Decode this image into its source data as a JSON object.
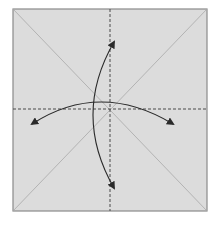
{
  "diagram": {
    "type": "origami-step",
    "colors": {
      "background": "#ffffff",
      "paper_fill": "#dcdcdc",
      "paper_border": "#8a8a8a",
      "crease_line": "#a8a8a8",
      "dashed_line": "#4a4a4a",
      "arrow": "#2a2a2a"
    },
    "paper": {
      "x": 13,
      "y": 9,
      "width": 194,
      "height": 202
    },
    "creases": [
      {
        "name": "diagonal-tl-br",
        "x1": 13,
        "y1": 9,
        "x2": 207,
        "y2": 211
      },
      {
        "name": "diagonal-tr-bl",
        "x1": 207,
        "y1": 9,
        "x2": 13,
        "y2": 211
      }
    ],
    "fold_lines": [
      {
        "name": "vertical-valley-fold",
        "x1": 110,
        "y1": 9,
        "x2": 110,
        "y2": 211,
        "style": "dashed"
      },
      {
        "name": "horizontal-valley-fold",
        "x1": 13,
        "y1": 109,
        "x2": 207,
        "y2": 109,
        "style": "dashed"
      }
    ],
    "arrows": [
      {
        "name": "horizontal-fold-unfold-arrow",
        "path": "M 32 124 Q 100 80 173 124",
        "heads": "both"
      },
      {
        "name": "vertical-fold-unfold-arrow",
        "path": "M 114 42 Q 72 115 114 188",
        "heads": "both"
      }
    ]
  }
}
